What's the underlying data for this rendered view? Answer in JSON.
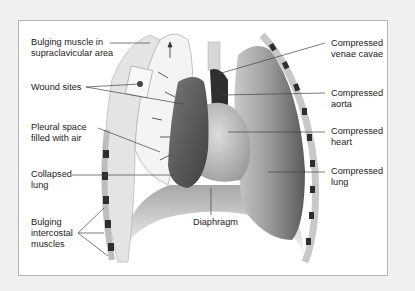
{
  "diagram": {
    "colors": {
      "background": "#f0f0f0",
      "frame_fill": "#ffffff",
      "frame_border": "#b5b5b5",
      "lung": "#8a8a8a",
      "collapsed_lung": "#5c5c5c",
      "rib_dark": "#2e2e2e",
      "leader_line": "#444444"
    },
    "labels_left": [
      {
        "id": "bulging-muscle",
        "text": "Bulging muscle in\nsupraclavicular area"
      },
      {
        "id": "wound-sites",
        "text": "Wound sites"
      },
      {
        "id": "pleural-space",
        "text": "Pleural space\nfilled with air"
      },
      {
        "id": "collapsed-lung",
        "text": "Collapsed\nlung"
      },
      {
        "id": "bulging-intercostal",
        "text": "Bulging\nintercostal\nmuscles"
      }
    ],
    "labels_right": [
      {
        "id": "compressed-venae-cavae",
        "text": "Compressed\nvenae cavae"
      },
      {
        "id": "compressed-aorta",
        "text": "Compressed\naorta"
      },
      {
        "id": "compressed-heart",
        "text": "Compressed\nheart"
      },
      {
        "id": "compressed-lung",
        "text": "Compressed\nlung"
      }
    ],
    "label_bottom": {
      "id": "diaphragm",
      "text": "Diaphragm"
    }
  }
}
